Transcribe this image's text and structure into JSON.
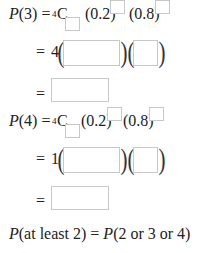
{
  "lines": {
    "p3": {
      "lhs_fn": "P",
      "lhs_arg": "(3)",
      "eq": "=",
      "n_sub": "4",
      "comb": "C",
      "p_base": "(0.2)",
      "q_base": "(0.8)"
    },
    "p3_step": {
      "eq": "=",
      "coef": "4",
      "open": "(",
      "close": ")"
    },
    "p3_result": {
      "eq": "="
    },
    "p4": {
      "lhs_fn": "P",
      "lhs_arg": "(4)",
      "eq": "=",
      "n_sub": "4",
      "comb": "C",
      "p_base": "(0.2)",
      "q_base": "(0.8)"
    },
    "p4_step": {
      "eq": "=",
      "coef": "1",
      "open": "(",
      "close": ")"
    },
    "p4_result": {
      "eq": "="
    },
    "at_least": {
      "lhs_fn": "P",
      "lhs_arg": "(at least 2)",
      "eq": "=",
      "rhs_fn": "P",
      "rhs_arg": "(2 or 3 or 4)"
    }
  },
  "inputs": {
    "p3_r": "",
    "p3_p_exp": "",
    "p3_q_exp": "",
    "p3_p_val": "",
    "p3_q_val": "",
    "p3_answer": "",
    "p4_r": "",
    "p4_p_exp": "",
    "p4_q_exp": "",
    "p4_p_val": "",
    "p4_q_val": "",
    "p4_answer": ""
  }
}
